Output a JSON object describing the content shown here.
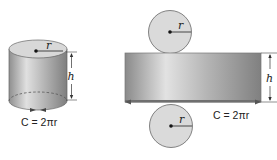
{
  "diagram": {
    "cylinder": {
      "radius_label": "r",
      "height_label": "h",
      "circumference_label": "C = 2πr"
    },
    "net": {
      "top_circle": {
        "radius_label": "r"
      },
      "bottom_circle": {
        "radius_label": "r"
      },
      "rectangle": {
        "height_label": "h",
        "width_label": "C = 2πr"
      }
    },
    "colors": {
      "surface_light": "#e6e6e6",
      "surface_dark": "#8c8c8c",
      "disc": "#d9d9d9",
      "outline": "#555555",
      "text": "#222222"
    }
  }
}
